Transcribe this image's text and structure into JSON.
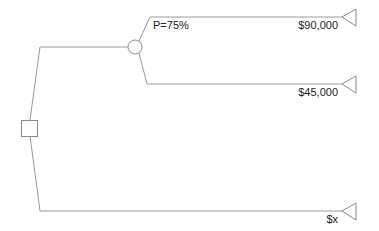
{
  "diagram": {
    "type": "decision-tree",
    "decision_node": {
      "shape": "square"
    },
    "chance_node": {
      "shape": "circle",
      "probability_label": "P=75%"
    },
    "outcomes": [
      {
        "label": "$90,000"
      },
      {
        "label": "$45,000"
      },
      {
        "label": "$x"
      }
    ],
    "colors": {
      "line": "#9a9a9a",
      "node_stroke": "#8a8a8a",
      "text": "#222222",
      "background": "#ffffff"
    }
  }
}
